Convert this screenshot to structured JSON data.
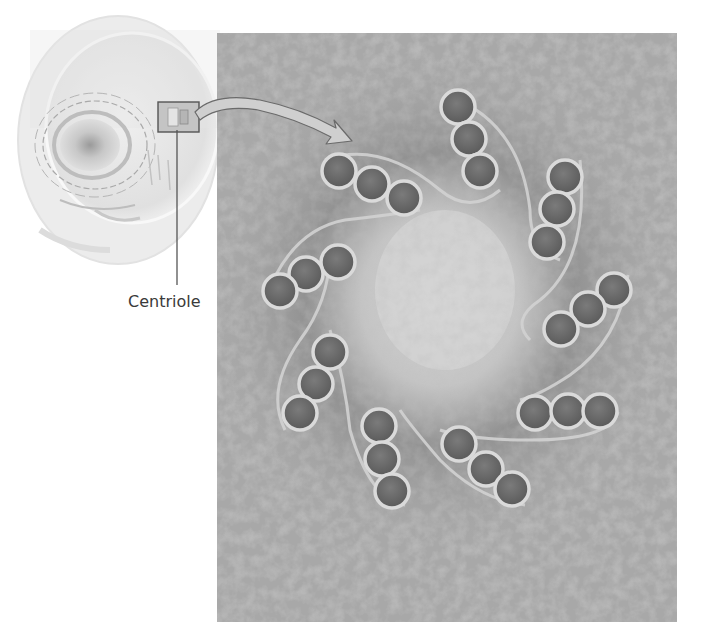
{
  "figure": {
    "labels": {
      "centriole": "Centriole"
    },
    "inset": {
      "description": "cell illustration with highlighted centriole region",
      "box_color": "#555555"
    },
    "micrograph": {
      "description": "electron micrograph of centriole in cross section",
      "triplet_count": 9,
      "microtubules_per_triplet": 3,
      "background_color": "#a8a8a8",
      "tubule_fill": "#6e6e6e",
      "tubule_ring": "#d8d8d8"
    }
  }
}
